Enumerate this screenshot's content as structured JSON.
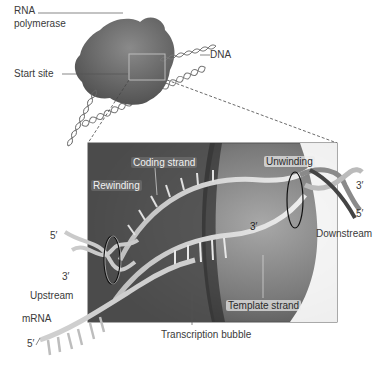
{
  "overview": {
    "labels": {
      "rna_polymerase_line1": "RNA",
      "rna_polymerase_line2": "polymerase",
      "start_site": "Start site",
      "dna": "DNA"
    }
  },
  "detail": {
    "labels": {
      "coding_strand": "Coding strand",
      "rewinding": "Rewinding",
      "unwinding": "Unwinding",
      "three_prime_center": "3′",
      "template_strand": "Template strand",
      "transcription_bubble": "Transcription bubble",
      "left_five_prime": "5′",
      "left_three_prime": "3′",
      "upstream": "Upstream",
      "mrna": "mRNA",
      "mrna_five_prime": "5′",
      "right_three_prime": "3′",
      "right_five_prime": "5′",
      "downstream": "Downstream"
    }
  },
  "colors": {
    "polymerase": "#6e6e6e",
    "box_bg_dark": "#4a4a4a",
    "box_bg_light": "#9a9a9a",
    "strand": "#d8d8d8",
    "label_text": "#3a3a3a"
  }
}
